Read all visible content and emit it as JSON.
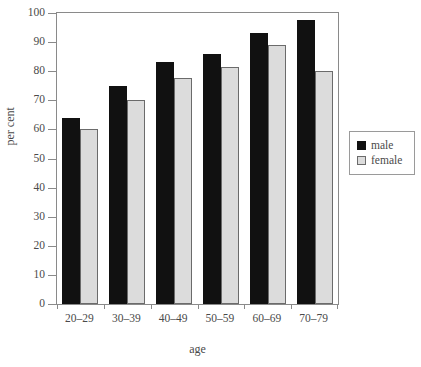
{
  "chart_data": {
    "type": "bar",
    "title": "",
    "subtitle": "",
    "xlabel": "age",
    "ylabel": "per cent",
    "categories": [
      "20–29",
      "30–39",
      "40–49",
      "50–59",
      "60–69",
      "70–79"
    ],
    "series": [
      {
        "name": "male",
        "color": "#111111",
        "values": [
          64,
          75,
          83,
          86,
          93,
          97.5
        ]
      },
      {
        "name": "female",
        "color": "#dcdcdc",
        "values": [
          60,
          70,
          77.5,
          81.5,
          89,
          80
        ]
      }
    ],
    "ylim": [
      0,
      100
    ],
    "yticks": [
      0,
      10,
      20,
      30,
      40,
      50,
      60,
      70,
      80,
      90,
      100
    ],
    "ytick_labels": [
      "0",
      "10",
      "20",
      "30",
      "40",
      "50",
      "60",
      "70",
      "80",
      "90",
      "100"
    ],
    "grid": false,
    "legend_position": "right",
    "legend_entries": [
      "male",
      "female"
    ],
    "frame": true,
    "annotations": []
  },
  "legend": {
    "items": [
      {
        "label": "male",
        "swatch": "male-swatch"
      },
      {
        "label": "female",
        "swatch": "female-swatch"
      }
    ]
  },
  "axes": {
    "x_title": "age",
    "y_title": "per cent"
  },
  "colors": {
    "male_bar": "#111111",
    "female_bar": "#dcdcdc",
    "female_bar_border": "#6b6b6b",
    "axis": "#8a8a8a",
    "text": "#4a4a4a",
    "background": "#ffffff"
  }
}
